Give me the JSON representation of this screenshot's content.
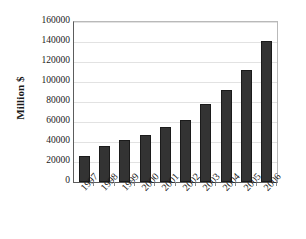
{
  "chart_data": {
    "type": "bar",
    "title": "",
    "xlabel": "",
    "ylabel": "Million $",
    "categories": [
      "1997",
      "1998",
      "1999",
      "2000",
      "2001",
      "2002",
      "2003",
      "2004",
      "2005",
      "2006"
    ],
    "values": [
      26000,
      36000,
      42000,
      47000,
      55000,
      62000,
      78000,
      92000,
      112500,
      141000
    ],
    "ylim": [
      0,
      160000
    ],
    "ytick_labels": [
      "0",
      "20000",
      "40000",
      "60000",
      "80000",
      "100000",
      "120000",
      "140000",
      "160000"
    ],
    "ytick_values": [
      0,
      20000,
      40000,
      60000,
      80000,
      100000,
      120000,
      140000,
      160000
    ],
    "grid": true,
    "legend": "none",
    "bar_color": "#333333",
    "bar_edge_color": "#1b1b1b",
    "grid_color": "#e2e2e2",
    "axis_color": "#5d5d5d",
    "background_color": "#ffffff"
  }
}
